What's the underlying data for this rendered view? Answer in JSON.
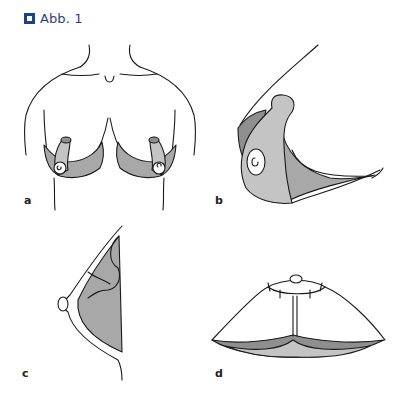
{
  "figure": {
    "title": "Abb. 1",
    "icon": "figure-square-icon",
    "accent_color": "#1f3f8f"
  },
  "panels": [
    {
      "label": "a",
      "description": "frontal view of torso with two inferior pedicles"
    },
    {
      "label": "b",
      "description": "oblique view of pedicle with nipple-areola complex"
    },
    {
      "label": "c",
      "description": "lateral profile view with shaded tissue"
    },
    {
      "label": "d",
      "description": "closure with vertical scar and periareolar sutures"
    }
  ],
  "colors": {
    "line": "#1a1a1a",
    "light_grey": "#c4c4c4",
    "mid_grey": "#a8a8a8",
    "dark_grey": "#8f8f8f"
  }
}
